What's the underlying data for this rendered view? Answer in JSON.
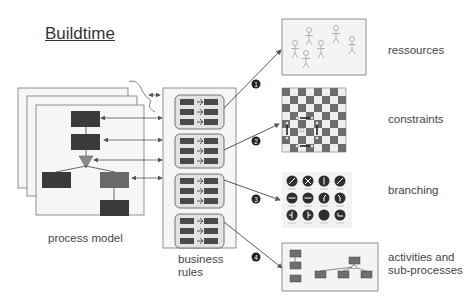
{
  "title": "Buildtime",
  "process_model": {
    "label": "process model"
  },
  "business_rules": {
    "label_line1": "business",
    "label_line2": "rules"
  },
  "targets": [
    {
      "number": "1",
      "label": "ressources",
      "icon": "people-icon"
    },
    {
      "number": "2",
      "label": "constraints",
      "icon": "chessboard-icon"
    },
    {
      "number": "3",
      "label": "branching",
      "icon": "traffic-signs-icon"
    },
    {
      "number": "4",
      "label_line1": "activities and",
      "label_line2": "sub-processes",
      "icon": "activity-diagram-icon"
    }
  ],
  "colors": {
    "dark_block": "#3a3a3a",
    "mid_block": "#6a6a6a",
    "triangle": "#888888",
    "panel": "#f4f4f4",
    "line": "#555555"
  }
}
